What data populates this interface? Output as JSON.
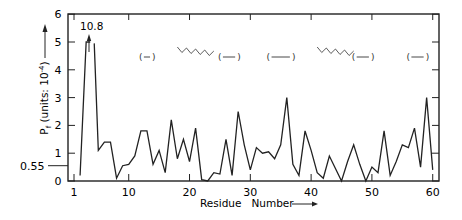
{
  "chart_data": {
    "type": "line",
    "title": "",
    "xlabel": "Residue   Number",
    "ylabel": "P_f (units: 10^-4)",
    "xlim": [
      0,
      61
    ],
    "ylim": [
      0,
      6
    ],
    "x_ticks": [
      1,
      10,
      20,
      30,
      40,
      50,
      60
    ],
    "y_ticks": [
      0,
      1,
      2,
      3,
      4,
      5,
      6
    ],
    "grid": false,
    "annotations": [
      {
        "text": "10.8",
        "x": 3,
        "y": 5.3,
        "note": "off-scale peak with upward arrow"
      },
      {
        "text": "0.55",
        "y": 0.55,
        "note": "reference level marked on y axis"
      }
    ],
    "secondary_structure": [
      {
        "type": "beta",
        "from": 12,
        "to": 14
      },
      {
        "type": "helix",
        "from": 18,
        "to": 24
      },
      {
        "type": "beta",
        "from": 25,
        "to": 28
      },
      {
        "type": "beta",
        "from": 33,
        "to": 37
      },
      {
        "type": "helix",
        "from": 41,
        "to": 47
      },
      {
        "type": "beta",
        "from": 47,
        "to": 50
      },
      {
        "type": "beta",
        "from": 56,
        "to": 59
      }
    ],
    "x": [
      2,
      3,
      4,
      5,
      6,
      7,
      8,
      9,
      10,
      11,
      12,
      13,
      14,
      15,
      16,
      17,
      18,
      19,
      20,
      21,
      22,
      23,
      24,
      25,
      26,
      27,
      28,
      29,
      30,
      31,
      32,
      33,
      34,
      35,
      36,
      37,
      38,
      39,
      40,
      41,
      42,
      43,
      44,
      45,
      46,
      47,
      48,
      49,
      50,
      51,
      52,
      53,
      54,
      55,
      56,
      57,
      58,
      59,
      60
    ],
    "values": [
      0.2,
      5.0,
      10.8,
      1.1,
      1.4,
      1.4,
      0.1,
      0.55,
      0.6,
      0.9,
      1.8,
      1.8,
      0.6,
      1.1,
      0.3,
      2.2,
      0.8,
      1.5,
      0.7,
      1.9,
      0.05,
      0.0,
      0.3,
      0.25,
      1.5,
      0.2,
      2.5,
      1.3,
      0.4,
      1.2,
      1.0,
      1.05,
      0.8,
      1.3,
      3.0,
      0.6,
      0.2,
      1.8,
      1.1,
      0.3,
      0.1,
      0.9,
      0.45,
      0.0,
      0.7,
      1.3,
      0.6,
      0.0,
      0.5,
      0.3,
      1.8,
      0.2,
      0.7,
      1.3,
      1.2,
      1.9,
      0.5,
      3.0,
      0.4
    ]
  }
}
